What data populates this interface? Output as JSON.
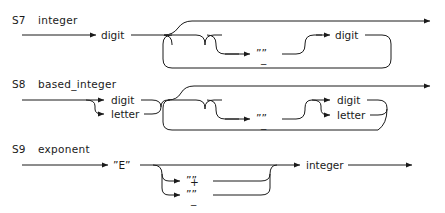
{
  "page": {
    "header_left": "",
    "header_mid": "",
    "header_right": "",
    "background": "#ffffff",
    "ink": "#1a1a1a"
  },
  "rules": [
    {
      "id": "S7",
      "name": "integer",
      "terminals": [
        {
          "key": "digit_1",
          "label": "digit"
        },
        {
          "key": "underscore",
          "label": "””"
        },
        {
          "key": "underscore_mark",
          "label": "_"
        },
        {
          "key": "digit_2",
          "label": "digit"
        }
      ]
    },
    {
      "id": "S8",
      "name": "based_integer",
      "terminals": [
        {
          "key": "digit_1",
          "label": "digit"
        },
        {
          "key": "letter_1",
          "label": "letter"
        },
        {
          "key": "underscore",
          "label": "””"
        },
        {
          "key": "underscore_mark",
          "label": "_"
        },
        {
          "key": "digit_2",
          "label": "digit"
        },
        {
          "key": "letter_2",
          "label": "letter"
        }
      ]
    },
    {
      "id": "S9",
      "name": "exponent",
      "terminals": [
        {
          "key": "e_literal",
          "label": "”E”"
        },
        {
          "key": "plus_quotes",
          "label": "””"
        },
        {
          "key": "plus_mark",
          "label": "+"
        },
        {
          "key": "minus_quotes",
          "label": "””"
        },
        {
          "key": "minus_mark",
          "label": "_"
        },
        {
          "key": "integer",
          "label": "integer"
        }
      ]
    }
  ]
}
